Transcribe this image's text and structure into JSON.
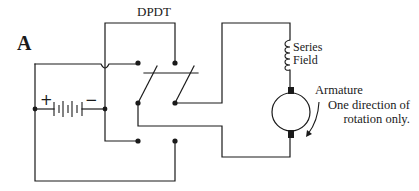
{
  "figure": {
    "label": "A"
  },
  "components": {
    "switch": {
      "label": "DPDT"
    },
    "battery": {
      "plus": "+",
      "minus": "−"
    },
    "series_field": {
      "line1": "Series",
      "line2": "Field"
    },
    "armature": {
      "label": "Armature"
    },
    "rotation_note": {
      "line1": "One direction of",
      "line2": "rotation only."
    }
  },
  "colors": {
    "line": "#1a1a1a",
    "background": "#ffffff"
  }
}
